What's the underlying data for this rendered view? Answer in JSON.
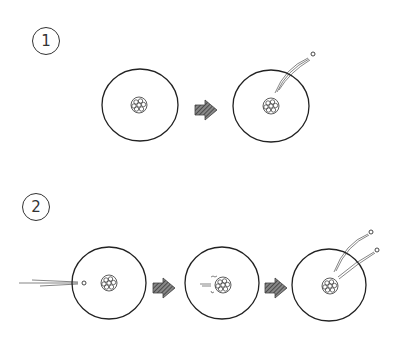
{
  "diagram": {
    "type": "hand-drawn sequence diagram",
    "stroke_color": "#222222",
    "arrow_fill": "#555555",
    "rows": [
      {
        "label": "1",
        "steps": [
          {
            "name": "nucleus-at-rest",
            "particles": 0
          },
          {
            "name": "nucleus-emits-particle",
            "particles": 1
          }
        ]
      },
      {
        "label": "2",
        "steps": [
          {
            "name": "incoming-particle",
            "particles": 1
          },
          {
            "name": "particle-absorbed",
            "particles": 0
          },
          {
            "name": "nucleus-emits-two-particles",
            "particles": 2
          }
        ]
      }
    ]
  }
}
